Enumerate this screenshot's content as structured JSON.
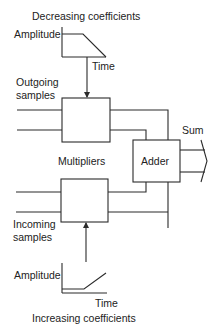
{
  "diagram": {
    "colors": {
      "stroke": "#2b2b2b",
      "text": "#222222",
      "background": "#ffffff"
    },
    "top_graph": {
      "title": "Decreasing coefficients",
      "y_label": "Amplitude",
      "x_label": "Time",
      "shape": "flat-then-ramp-down"
    },
    "bottom_graph": {
      "title": "Increasing coefficients",
      "y_label": "Amplitude",
      "x_label": "Time",
      "shape": "flat-then-ramp-up"
    },
    "inputs": {
      "outgoing": [
        "Outgoing",
        "samples"
      ],
      "incoming": [
        "Incoming",
        "samples"
      ]
    },
    "multipliers_label": "Multipliers",
    "adder_label": "Adder",
    "output_label": "Sum"
  }
}
